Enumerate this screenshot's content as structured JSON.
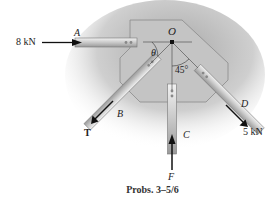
{
  "figure": {
    "caption": "Probs. 3–5/6",
    "point_label": "O",
    "members": {
      "A": "A",
      "B": "B",
      "C": "C",
      "D": "D"
    },
    "forces": {
      "A_force": "8 kN",
      "B_force": "T",
      "C_force": "F",
      "D_force": "5 kN"
    },
    "angles": {
      "theta": "θ",
      "angle_45": "45°"
    },
    "colors": {
      "plate": "#bdbdbd",
      "member": "#d9d9d9",
      "arrow": "#111111",
      "text": "#222222"
    }
  }
}
